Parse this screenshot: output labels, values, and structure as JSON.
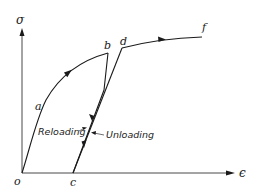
{
  "diagram": {
    "axes": {
      "y_label": "σ",
      "x_label": "ϵ"
    },
    "points": {
      "o": "o",
      "a": "a",
      "b": "b",
      "c": "c",
      "d": "d",
      "f": "f"
    },
    "annotations": {
      "reloading": "Reloading",
      "unloading": "Unloading"
    },
    "colors": {
      "line": "#1a1a1a",
      "background": "#ffffff"
    }
  }
}
